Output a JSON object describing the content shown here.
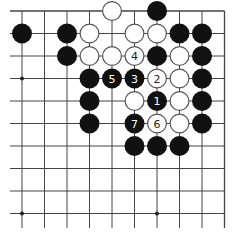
{
  "board": {
    "title": "Go problem diagram",
    "origin_x": 22,
    "origin_y": 11,
    "spacing": 22.5,
    "cols": 10,
    "rows": 10,
    "line_color": "#444444",
    "edges": {
      "top": true,
      "right": true,
      "left": false,
      "bottom": false
    },
    "star_points": [
      [
        0,
        3
      ],
      [
        0,
        9
      ],
      [
        6,
        9
      ]
    ],
    "stone_radius": 10,
    "black_color": "#111111",
    "white_fill": "#ffffff",
    "white_stroke": "#555555"
  },
  "stones": [
    {
      "c": 4,
      "r": 0,
      "color": "white"
    },
    {
      "c": 6,
      "r": 0,
      "color": "black"
    },
    {
      "c": 0,
      "r": 1,
      "color": "black"
    },
    {
      "c": 2,
      "r": 1,
      "color": "black"
    },
    {
      "c": 3,
      "r": 1,
      "color": "white"
    },
    {
      "c": 5,
      "r": 1,
      "color": "white"
    },
    {
      "c": 6,
      "r": 1,
      "color": "white"
    },
    {
      "c": 7,
      "r": 1,
      "color": "black"
    },
    {
      "c": 8,
      "r": 1,
      "color": "black"
    },
    {
      "c": 2,
      "r": 2,
      "color": "black"
    },
    {
      "c": 3,
      "r": 2,
      "color": "white"
    },
    {
      "c": 4,
      "r": 2,
      "color": "white"
    },
    {
      "c": 5,
      "r": 2,
      "color": "white",
      "label": "4"
    },
    {
      "c": 6,
      "r": 2,
      "color": "black"
    },
    {
      "c": 7,
      "r": 2,
      "color": "white"
    },
    {
      "c": 8,
      "r": 2,
      "color": "black"
    },
    {
      "c": 3,
      "r": 3,
      "color": "black"
    },
    {
      "c": 4,
      "r": 3,
      "color": "black",
      "label": "5"
    },
    {
      "c": 5,
      "r": 3,
      "color": "black",
      "label": "3"
    },
    {
      "c": 6,
      "r": 3,
      "color": "white",
      "label": "2"
    },
    {
      "c": 7,
      "r": 3,
      "color": "white"
    },
    {
      "c": 8,
      "r": 3,
      "color": "black"
    },
    {
      "c": 3,
      "r": 4,
      "color": "black"
    },
    {
      "c": 5,
      "r": 4,
      "color": "white"
    },
    {
      "c": 6,
      "r": 4,
      "color": "black",
      "label": "1"
    },
    {
      "c": 7,
      "r": 4,
      "color": "white"
    },
    {
      "c": 8,
      "r": 4,
      "color": "black"
    },
    {
      "c": 3,
      "r": 5,
      "color": "black"
    },
    {
      "c": 5,
      "r": 5,
      "color": "black",
      "label": "7"
    },
    {
      "c": 6,
      "r": 5,
      "color": "white",
      "label": "6"
    },
    {
      "c": 7,
      "r": 5,
      "color": "white"
    },
    {
      "c": 8,
      "r": 5,
      "color": "black"
    },
    {
      "c": 5,
      "r": 6,
      "color": "black"
    },
    {
      "c": 6,
      "r": 6,
      "color": "black"
    },
    {
      "c": 7,
      "r": 6,
      "color": "black"
    }
  ]
}
